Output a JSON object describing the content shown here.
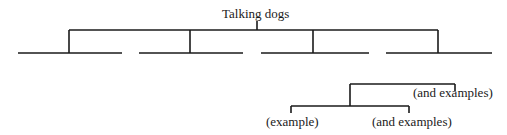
{
  "diagram": {
    "root": {
      "label": "Talking dogs"
    },
    "branches": [
      {
        "label": ""
      },
      {
        "label": ""
      },
      {
        "label": ""
      },
      {
        "label": ""
      }
    ],
    "subtree": {
      "top_right_label": "(and examples)",
      "bottom_left_label": "(example)",
      "bottom_right_label": "(and examples)"
    },
    "colors": {
      "line": "#1a1a1a",
      "background": "#ffffff"
    }
  }
}
